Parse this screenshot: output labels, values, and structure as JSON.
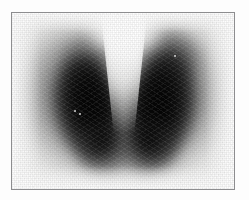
{
  "document": {
    "kind": "nuclear-medicine-scintigram",
    "modality_label": "Thyroid scintigraphy (gamma camera planar scan)",
    "orientation": "anterior",
    "colormap": "grayscale-inverted (dark = high radiotracer uptake)",
    "caption": ""
  },
  "frame": {
    "border_color": "#8d8d8f",
    "border_width_px": 1,
    "page_background": "#fdfdfd",
    "film_background": "#f7f7f6",
    "left_px": 11,
    "top_px": 12,
    "width_px": 224,
    "height_px": 178
  },
  "scan": {
    "background_tone": "#f4f4f3",
    "max_uptake_tone": "#000000",
    "mid_uptake_tone": "#505050",
    "low_uptake_tone": "#b8b8b8",
    "regions": [
      {
        "name": "right-lobe",
        "side_on_image": "viewer-left",
        "uptake": "intense",
        "description": "Elongated vertically oriented lobe with dense black core, diffuse gray halo"
      },
      {
        "name": "left-lobe",
        "side_on_image": "viewer-right",
        "uptake": "intense",
        "description": "Elongated vertically oriented lobe with dense black core, diffuse gray halo"
      },
      {
        "name": "isthmus",
        "side_on_image": "center-inferior",
        "uptake": "moderate",
        "description": "Bridging activity joining the two lobes inferiorly, forming a V / butterfly shape"
      },
      {
        "name": "midline-photopenic-wedge",
        "side_on_image": "center-superior",
        "uptake": "absent",
        "description": "Light wedge of absent tracer between the superior poles (trachea)"
      }
    ],
    "artifacts": [
      {
        "name": "hot-pixel",
        "x_pct": 28,
        "y_pct": 55
      },
      {
        "name": "hot-pixel",
        "x_pct": 30,
        "y_pct": 57
      },
      {
        "name": "hot-pixel",
        "x_pct": 73,
        "y_pct": 24
      }
    ]
  }
}
